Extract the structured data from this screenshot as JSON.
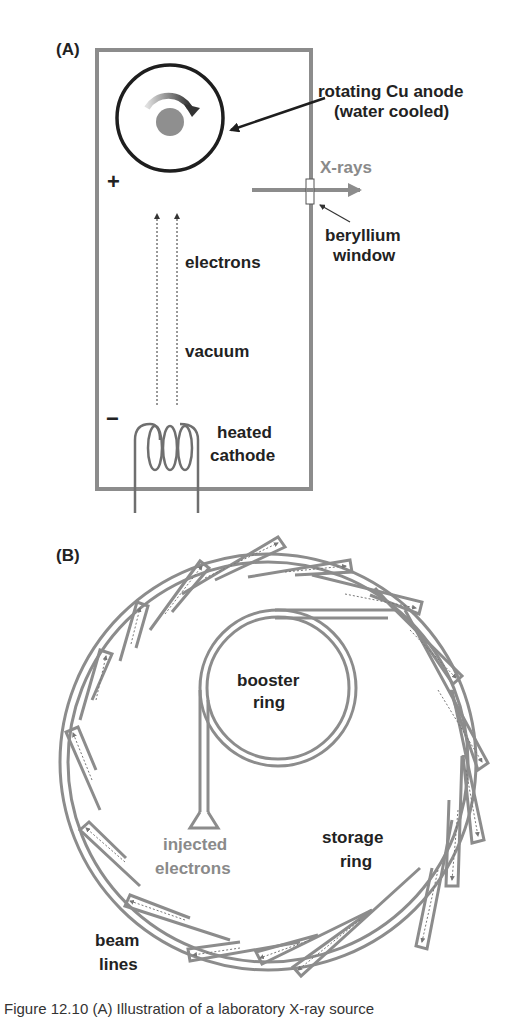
{
  "panel_a": {
    "tag": "(A)",
    "labels": {
      "anode_line1": "rotating Cu anode",
      "anode_line2": "(water cooled)",
      "xrays": "X-rays",
      "window_line1": "beryllium",
      "window_line2": "window",
      "electrons": "electrons",
      "vacuum": "vacuum",
      "cathode_line1": "heated",
      "cathode_line2": "cathode",
      "plus": "+",
      "minus": "−"
    }
  },
  "panel_b": {
    "tag": "(B)",
    "labels": {
      "booster_line1": "booster",
      "booster_line2": "ring",
      "storage_line1": "storage",
      "storage_line2": "ring",
      "injected_line1": "injected",
      "injected_line2": "electrons",
      "beamlines_line1": "beam",
      "beamlines_line2": "lines"
    }
  },
  "caption": "Figure 12.10 (A) Illustration of a laboratory X-ray source",
  "colors": {
    "outline_grey": "#8c8c8c",
    "text_dark": "#222222",
    "text_grey": "#8a8a8a",
    "anode_black": "#1e1e1e"
  }
}
